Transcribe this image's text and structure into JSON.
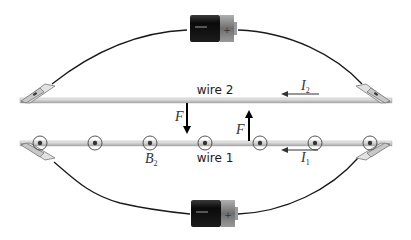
{
  "diagram": {
    "wires": [
      {
        "id": "wire2",
        "label": "wire 2",
        "current_label": "I",
        "current_sub": "2",
        "current_direction": "left"
      },
      {
        "id": "wire1",
        "label": "wire 1",
        "current_label": "I",
        "current_sub": "1",
        "current_direction": "left"
      }
    ],
    "forces": [
      {
        "label": "F",
        "on": "wire 2",
        "direction": "down"
      },
      {
        "label": "F",
        "on": "wire 1",
        "direction": "up"
      }
    ],
    "field": {
      "label": "B",
      "sub": "2",
      "symbol": "out-of-page dot-in-circle",
      "count": 7
    },
    "batteries": [
      {
        "position": "top",
        "terminal_mark": "+"
      },
      {
        "position": "bottom",
        "terminal_mark": "+"
      }
    ],
    "colors": {
      "wire_rod": "#d8d8d8",
      "lead_wire": "#1a1a1a",
      "battery_body": "#111111",
      "battery_cap": "#8a8a8a",
      "arrow": "#000000",
      "field_symbol": "#333333"
    }
  }
}
